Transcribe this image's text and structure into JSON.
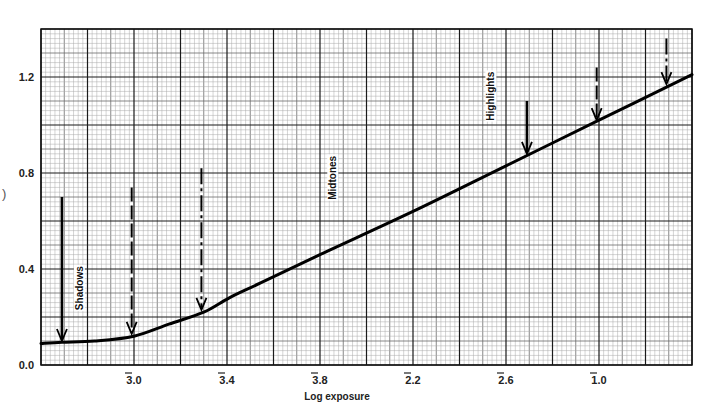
{
  "chart_data": {
    "type": "line",
    "title": "",
    "xlabel": "Log exposure",
    "ylabel": "",
    "xlim": [
      -3.4,
      -0.6
    ],
    "ylim": [
      0.0,
      1.4
    ],
    "grid": true,
    "legend": null,
    "x_ticks": [
      {
        "value": -3.0,
        "label": "3.0",
        "bar": "3"
      },
      {
        "value": -2.6,
        "label": "3.4",
        "bar": "3"
      },
      {
        "value": -2.2,
        "label": "3.8",
        "bar": "3"
      },
      {
        "value": -1.8,
        "label": "2.2",
        "bar": "2"
      },
      {
        "value": -1.4,
        "label": "2.6",
        "bar": "2"
      },
      {
        "value": -1.0,
        "label": "1.0",
        "bar": "1"
      }
    ],
    "x_tick_note": "Bar-notation logarithms: e.g. 3̄.0 = -3.0 + 0.0 ... labels read 3̄.0, 3̄.4, 3̄.8, 2̄.2, 2̄.6, 1̄.0",
    "y_ticks": [
      0.0,
      0.4,
      0.8,
      1.2
    ],
    "y_tick_labels": [
      "0.0",
      "0.4",
      "0.8",
      "1.2"
    ],
    "series": [
      {
        "name": "Characteristic curve",
        "x": [
          -3.4,
          -3.31,
          -3.17,
          -3.0,
          -2.85,
          -2.7,
          -2.59,
          -2.46,
          -2.2,
          -1.8,
          -1.4,
          -1.0,
          -0.6
        ],
        "y": [
          0.09,
          0.095,
          0.1,
          0.12,
          0.17,
          0.22,
          0.28,
          0.34,
          0.46,
          0.64,
          0.83,
          1.02,
          1.21
        ]
      }
    ],
    "annotations": [
      {
        "type": "label",
        "text": "Shadows",
        "x": -3.22,
        "y": 0.32,
        "rotation": -90
      },
      {
        "type": "label",
        "text": "Midtones",
        "x": -2.13,
        "y": 0.78,
        "rotation": -90
      },
      {
        "type": "label",
        "text": "Highlights",
        "x": -1.45,
        "y": 1.12,
        "rotation": -90
      },
      {
        "type": "arrow",
        "style": "solid",
        "x": -3.31,
        "y_from": 0.7,
        "y_to": 0.1,
        "group": "Shadows"
      },
      {
        "type": "arrow",
        "style": "dashed",
        "x": -3.01,
        "y_from": 0.74,
        "y_to": 0.13,
        "group": "Shadows"
      },
      {
        "type": "arrow",
        "style": "dashdot",
        "x": -2.71,
        "y_from": 0.82,
        "y_to": 0.23,
        "group": "Shadows"
      },
      {
        "type": "arrow",
        "style": "solid",
        "x": -1.31,
        "y_from": 1.1,
        "y_to": 0.88,
        "group": "Highlights"
      },
      {
        "type": "arrow",
        "style": "dashed",
        "x": -1.01,
        "y_from": 1.24,
        "y_to": 1.02,
        "group": "Highlights"
      },
      {
        "type": "arrow",
        "style": "dashdot",
        "x": -0.71,
        "y_from": 1.36,
        "y_to": 1.17,
        "group": "Highlights"
      }
    ]
  },
  "artifact_glyph": ")"
}
